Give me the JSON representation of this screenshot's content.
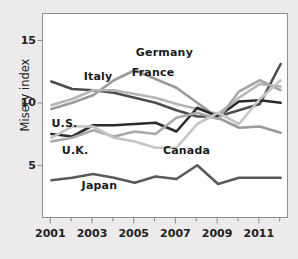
{
  "chart_data": {
    "type": "line",
    "title": "",
    "xlabel": "",
    "ylabel": "Misery index",
    "x": [
      2001,
      2002,
      2003,
      2004,
      2005,
      2006,
      2007,
      2008,
      2009,
      2010,
      2011,
      2012
    ],
    "xlim": [
      2000.6,
      2012.4
    ],
    "ylim": [
      0.8,
      17.2
    ],
    "xticks": [
      2001,
      2003,
      2005,
      2007,
      2009,
      2011
    ],
    "xticklabels": [
      "2001",
      "2003",
      "2005",
      "2007",
      "2009",
      "2011"
    ],
    "yticks": [
      5,
      10,
      15
    ],
    "yticklabels": [
      "5",
      "10",
      "15"
    ],
    "minor_xticks": [
      2002,
      2004,
      2006,
      2008,
      2010,
      2012
    ],
    "grid": false,
    "legend_position": "inline-labels",
    "series": [
      {
        "name": "Italy",
        "color": "#4d4d4d",
        "label_x": 2002.6,
        "label_y": 12.1,
        "values": [
          11.8,
          11.2,
          11.1,
          10.9,
          10.5,
          10.1,
          9.5,
          9.0,
          9.0,
          9.5,
          10.0,
          13.2
        ]
      },
      {
        "name": "Germany",
        "color": "#9a9a9a",
        "label_x": 2005.1,
        "label_y": 14.0,
        "values": [
          9.6,
          10.1,
          10.7,
          11.9,
          12.7,
          12.0,
          11.3,
          10.1,
          8.9,
          8.1,
          8.2,
          7.7
        ]
      },
      {
        "name": "France",
        "color": "#b5b5b5",
        "label_x": 2004.9,
        "label_y": 12.4,
        "values": [
          9.9,
          10.4,
          11.1,
          11.1,
          10.8,
          10.5,
          10.0,
          9.6,
          9.2,
          10.5,
          11.6,
          11.4
        ]
      },
      {
        "name": "U.S.",
        "color": "#2b2b2b",
        "label_x": 2001.05,
        "label_y": 8.3,
        "values": [
          7.6,
          7.4,
          8.3,
          8.3,
          8.4,
          8.5,
          7.8,
          9.7,
          9.0,
          10.2,
          10.3,
          10.1
        ]
      },
      {
        "name": "U.K.",
        "color": "#a8a8a8",
        "label_x": 2001.55,
        "label_y": 6.2,
        "values": [
          7.0,
          7.3,
          7.9,
          7.4,
          7.8,
          7.6,
          8.9,
          9.3,
          8.8,
          11.0,
          11.9,
          11.1
        ]
      },
      {
        "name": "Canada",
        "color": "#c4c4c4",
        "label_x": 2006.4,
        "label_y": 6.2,
        "values": [
          7.3,
          8.2,
          8.2,
          7.3,
          7.0,
          6.5,
          6.5,
          8.4,
          9.3,
          8.4,
          10.4,
          11.9
        ]
      },
      {
        "name": "Japan",
        "color": "#5a5a5a",
        "label_x": 2002.5,
        "label_y": 3.4,
        "values": [
          3.9,
          4.1,
          4.4,
          4.1,
          3.7,
          4.2,
          4.0,
          5.1,
          3.6,
          4.1,
          4.1,
          4.1
        ]
      }
    ]
  }
}
